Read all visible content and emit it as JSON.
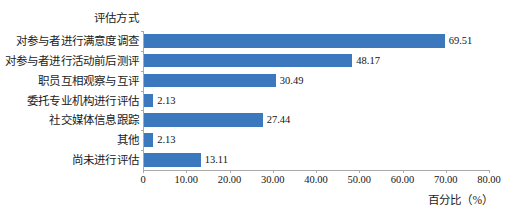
{
  "chart_data": {
    "type": "bar",
    "orientation": "horizontal",
    "title": "",
    "category_axis_title": "评估方式",
    "xlabel": "百分比（%）",
    "ylabel": "",
    "xlim": [
      0,
      80
    ],
    "xticks": [
      "0",
      "10.00",
      "20.00",
      "30.00",
      "40.00",
      "50.00",
      "60.00",
      "70.00",
      "80.00"
    ],
    "xtick_values": [
      0,
      10,
      20,
      30,
      40,
      50,
      60,
      70,
      80
    ],
    "grid": false,
    "legend": "none",
    "bar_color": "#3c78bd",
    "axis_color": "#a9a9a9",
    "categories": [
      "对参与者进行满意度调查",
      "对参与者进行活动前后测评",
      "职员互相观察与互评",
      "委托专业机构进行评估",
      "社交媒体信息跟踪",
      "其他",
      "尚未进行评估"
    ],
    "values": [
      69.51,
      48.17,
      30.49,
      2.13,
      27.44,
      2.13,
      13.11
    ],
    "value_labels": [
      "69.51",
      "48.17",
      "30.49",
      "2.13",
      "27.44",
      "2.13",
      "13.11"
    ]
  }
}
